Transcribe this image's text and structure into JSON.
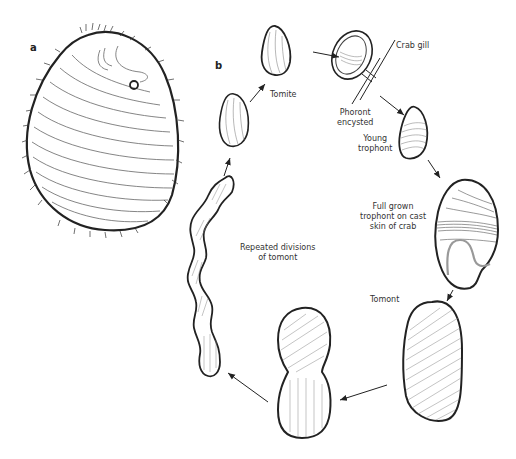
{
  "figure": {
    "panels": {
      "a": {
        "letter": "a"
      },
      "b": {
        "letter": "b"
      }
    },
    "stages": [
      {
        "id": "tomite",
        "label": "Tomite"
      },
      {
        "id": "phoront",
        "label_line1": "Phoront",
        "label_line2": "encysted"
      },
      {
        "id": "crab_gill",
        "label": "Crab gill"
      },
      {
        "id": "young_trophont",
        "label_line1": "Young",
        "label_line2": "trophont"
      },
      {
        "id": "full_grown",
        "label_line1": "Full grown",
        "label_line2": "trophont on cast",
        "label_line3": "skin of crab"
      },
      {
        "id": "tomont",
        "label": "Tomont"
      },
      {
        "id": "divisions",
        "label_line1": "Repeated divisions",
        "label_line2": "of tomont"
      }
    ],
    "colors": {
      "ink": "#222222",
      "hatch": "#777777",
      "background": "#ffffff"
    }
  }
}
